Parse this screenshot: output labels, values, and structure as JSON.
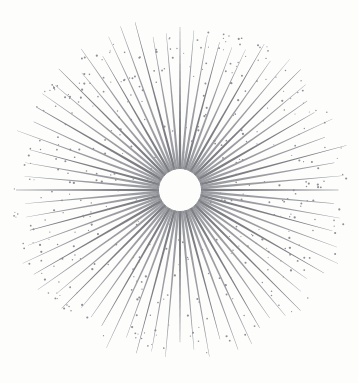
{
  "artwork": {
    "title": "Sunburst Starburst Ornament",
    "style": "vintage-engraving",
    "background_color": "#fdfdfc"
  },
  "canvas": {
    "width": 358,
    "height": 383
  },
  "burst": {
    "name": "radial-sunburst",
    "center_x": 180,
    "center_y": 190,
    "ray_count": 72,
    "ray_color": "#7d7f84",
    "ray_color_light": "#9b9da2",
    "inner_radius": 21,
    "outer_radius_x": 165,
    "outer_radius_y": 163,
    "ray_base_width": 2.6,
    "ray_length_variation": 0.07,
    "rotation_offset_deg": -90
  },
  "hub": {
    "name": "hub-dot-ring",
    "dot_count": 58,
    "dot_radius": 0.85,
    "ring_radius": 22.5,
    "dot_color": "#8b8d92",
    "hole_fill": "#fdfdfc"
  },
  "specks": {
    "name": "scattered-specks",
    "count": 420,
    "min_radius": 0.5,
    "max_radius": 1.15,
    "color": "#8e9095",
    "inner_bound": 26,
    "outer_bound": 168,
    "seed": 20240517
  }
}
